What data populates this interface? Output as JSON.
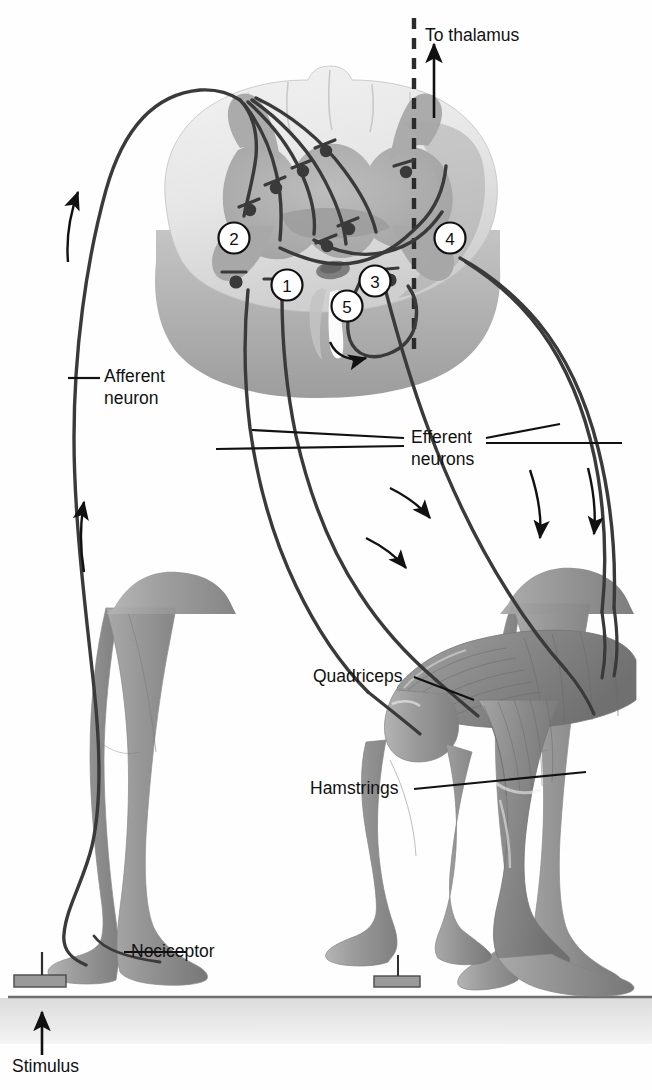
{
  "figure": {
    "background_color": "#fefefe",
    "line_color": "#2b2b2b",
    "text_color": "#111111"
  },
  "labels": {
    "to_thalamus": "To thalamus",
    "afferent_neuron": "Afferent\nneuron",
    "afferent_neuron_line1": "Afferent",
    "afferent_neuron_line2": "neuron",
    "efferent_neurons_line1": "Efferent",
    "efferent_neurons_line2": "neurons",
    "quadriceps": "Quadriceps",
    "hamstrings": "Hamstrings",
    "nociceptor": "Nociceptor",
    "stimulus": "Stimulus"
  },
  "callouts": [
    {
      "id": 1,
      "text": "1",
      "cx": 287,
      "cy": 285
    },
    {
      "id": 2,
      "text": "2",
      "cx": 234,
      "cy": 238
    },
    {
      "id": 3,
      "text": "3",
      "cx": 375,
      "cy": 281
    },
    {
      "id": 4,
      "text": "4",
      "cx": 450,
      "cy": 238
    },
    {
      "id": 5,
      "text": "5",
      "cx": 347,
      "cy": 306
    }
  ],
  "anatomy": {
    "spinal_cord": {
      "name": "spinal cord cross-section",
      "white_matter_color": "#e4e4e4",
      "gray_matter_color": "#b0b0b0",
      "gray_matter_shadow": "#9a9a9a",
      "rim_color": "#a8a8a8",
      "central_canal_color": "#7e7e7e"
    },
    "legs": {
      "left_leg": "extended supporting leg",
      "right_leg": "flexed withdrawn leg",
      "skin_color": "#9e9e9e",
      "muscle_color": "#8c8c8c"
    },
    "ground": {
      "surface_color": "#d8d8d8",
      "line_color": "#6f6f6f"
    },
    "stimulus_objects": [
      {
        "name": "tack-left",
        "x": 36
      },
      {
        "name": "tack-right",
        "x": 396
      }
    ]
  },
  "arrows": {
    "to_thalamus_direction": "up",
    "afferent_direction": "up",
    "efferent_direction": "down",
    "crossed_direction": "right"
  }
}
